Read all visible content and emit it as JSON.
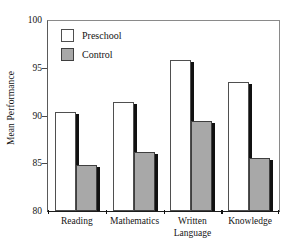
{
  "chart_data": {
    "type": "bar",
    "title": "",
    "xlabel": "",
    "ylabel": "Mean Performance",
    "ylim": [
      80,
      100
    ],
    "yticks": [
      80,
      85,
      90,
      95,
      100
    ],
    "ytick_labels": [
      "80",
      "85",
      "90",
      "95",
      "100"
    ],
    "grid": false,
    "legend_position": "upper-left-inside",
    "categories": [
      "Reading",
      "Mathematics",
      "Written Language",
      "Knowledge"
    ],
    "series": [
      {
        "name": "Preschool",
        "color": "#ffffff",
        "edge_color": "#4f4f4f",
        "values": [
          90.4,
          91.4,
          95.8,
          93.5
        ]
      },
      {
        "name": "Control",
        "color": "#a8a8a8",
        "edge_color": "#3f3f3f",
        "values": [
          84.8,
          86.2,
          89.4,
          85.5
        ]
      }
    ]
  },
  "axis": {
    "y_title": "Mean Performance",
    "y_ticks": [
      {
        "label": "100",
        "value": 100
      },
      {
        "label": "95",
        "value": 95
      },
      {
        "label": "90",
        "value": 90
      },
      {
        "label": "85",
        "value": 85
      },
      {
        "label": "80",
        "value": 80
      }
    ],
    "x_categories": [
      {
        "line1": "Reading",
        "line2": ""
      },
      {
        "line1": "Mathematics",
        "line2": ""
      },
      {
        "line1": "Written",
        "line2": "Language"
      },
      {
        "line1": "Knowledge",
        "line2": ""
      }
    ]
  },
  "legend": {
    "items": [
      {
        "label": "Preschool",
        "swatch": "white-square-swatch"
      },
      {
        "label": "Control",
        "swatch": "gray-square-swatch"
      }
    ]
  }
}
